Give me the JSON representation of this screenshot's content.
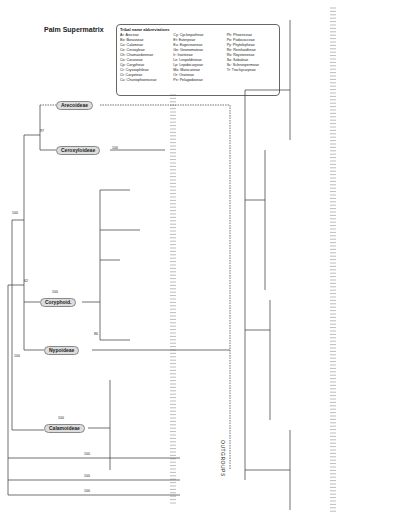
{
  "figure": {
    "title": "Palm Supermatrix"
  },
  "legend": {
    "heading": "Tribal name abbreviations",
    "columns": [
      [
        "Ar: Areceae",
        "Bo: Borasseae",
        "Ca: Calameae",
        "Ce: Ceroxyleae",
        "Ch: Chamaedoreeae",
        "Co: Cocoseae",
        "Cp: Corypheae",
        "Cr: Cryosophileae",
        "Ct: Caryoteae",
        "Cu: Chuniophoeniceae"
      ],
      [
        "Cy: Cyclospatheae",
        "Et: Euterpeae",
        "Eu: Eugeissoneae",
        "Ge: Geonomateae",
        "Ir: Iriarteeae",
        "Le: Leopoldinieae",
        "Lp: Lepidocaryeae",
        "Ma: Manicarieae",
        "Or: Oranieae",
        "Pe: Pelagodoxeae"
      ],
      [
        "Ph: Phoeniceae",
        "Po: Podococceae",
        "Py: Phytelepheae",
        "Re: Reinhardtieae",
        "Ro: Roystoneeae",
        "Sa: Sabaleae",
        "Sc: Sclerospermeae",
        "Tr: Trachycarpeae"
      ]
    ]
  },
  "clades": [
    {
      "label": "Arecoideae",
      "x": 56,
      "y": 105
    },
    {
      "label": "Ceroxyloideae",
      "x": 56,
      "y": 150
    },
    {
      "label": "Coryphoid.",
      "x": 40,
      "y": 302
    },
    {
      "label": "Nypoideae",
      "x": 44,
      "y": 350
    },
    {
      "label": "Calamoideae",
      "x": 44,
      "y": 428
    }
  ],
  "support": [
    {
      "v": "97",
      "x": 40,
      "y": 135
    },
    {
      "v": "100",
      "x": 112,
      "y": 152
    },
    {
      "v": "100",
      "x": 12,
      "y": 217
    },
    {
      "v": "62",
      "x": 24,
      "y": 285
    },
    {
      "v": "100",
      "x": 52,
      "y": 296
    },
    {
      "v": "86",
      "x": 94,
      "y": 338
    },
    {
      "v": "100",
      "x": 14,
      "y": 360
    },
    {
      "v": "100",
      "x": 58,
      "y": 422
    },
    {
      "v": "100",
      "x": 84,
      "y": 458
    },
    {
      "v": "100",
      "x": 84,
      "y": 480
    },
    {
      "v": "100",
      "x": 84,
      "y": 495
    }
  ],
  "outgroup_label": "OUTGROUPS"
}
